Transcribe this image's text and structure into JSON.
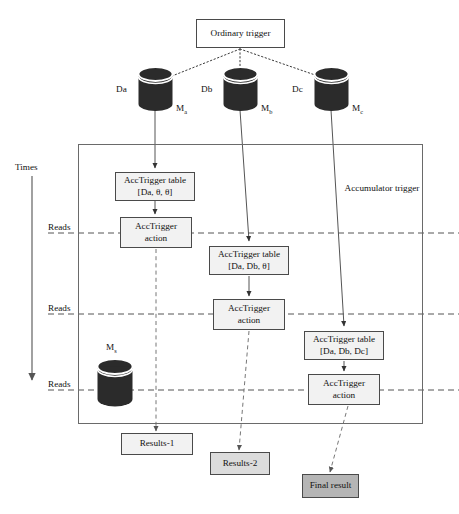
{
  "diagram": {
    "title_node": {
      "label": "Ordinary trigger"
    },
    "container": {
      "label_line1": "Accumulator",
      "label_line2": "trigger"
    },
    "axis": {
      "label": "Times"
    },
    "reads_labels": [
      "Reads",
      "Reads",
      "Reads"
    ],
    "databases": [
      {
        "name": "Da",
        "machine": "M",
        "machine_sub": "a"
      },
      {
        "name": "Db",
        "machine": "M",
        "machine_sub": "b"
      },
      {
        "name": "Dc",
        "machine": "M",
        "machine_sub": "c"
      }
    ],
    "store_node": {
      "machine": "M",
      "machine_sub": "s"
    },
    "tables": [
      {
        "line1": "AccTrigger table",
        "line2": "[Da, θ, θ]"
      },
      {
        "line1": "AccTrigger table",
        "line2": "[Da, Db, θ]"
      },
      {
        "line1": "AccTrigger table",
        "line2": "[Da, Db, Dc]"
      }
    ],
    "actions": [
      {
        "line1": "AccTrigger",
        "line2": "action"
      },
      {
        "line1": "AccTrigger",
        "line2": "action"
      },
      {
        "line1": "AccTrigger",
        "line2": "action"
      }
    ],
    "results": [
      {
        "label": "Results-1",
        "shade": "#f2f2f2"
      },
      {
        "label": "Results-2",
        "shade": "#dcdcdc"
      },
      {
        "label": "Final result",
        "shade": "#b5b5b5"
      }
    ],
    "colors": {
      "cylinder_body": "#2b2b2b",
      "cylinder_band": "#ffffff",
      "line": "#4a4a4a",
      "container_border": "#6a6a6a",
      "text": "#111111"
    }
  }
}
